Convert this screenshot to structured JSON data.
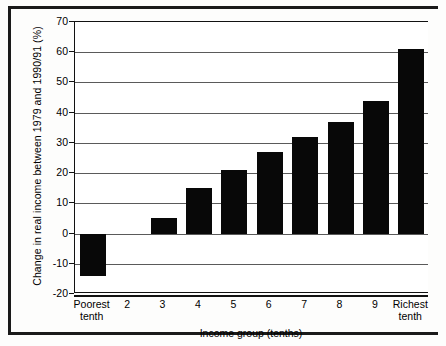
{
  "chart_data": {
    "type": "bar",
    "title": "",
    "ylabel": "Change in real income between 1979 and 1990/91 (%)",
    "xlabel": "Income group (tenths)",
    "categories": [
      "Poorest tenth",
      "2",
      "3",
      "4",
      "5",
      "6",
      "7",
      "8",
      "9",
      "Richest tenth"
    ],
    "values": [
      -14,
      0,
      5,
      15,
      21,
      27,
      32,
      37,
      44,
      61
    ],
    "ylim": [
      -20,
      70
    ],
    "yticks": [
      70,
      60,
      50,
      40,
      30,
      20,
      10,
      0,
      -10,
      -20
    ],
    "ytick_labels": [
      "70",
      "60",
      "50",
      "40",
      "30",
      "20",
      "10",
      "0",
      "-10",
      "-20"
    ],
    "grid": true,
    "legend": false,
    "bar_color": "#080808",
    "axis_color": "#111111",
    "gridline_color": "#5a5a5a",
    "background": "#ffffff"
  }
}
